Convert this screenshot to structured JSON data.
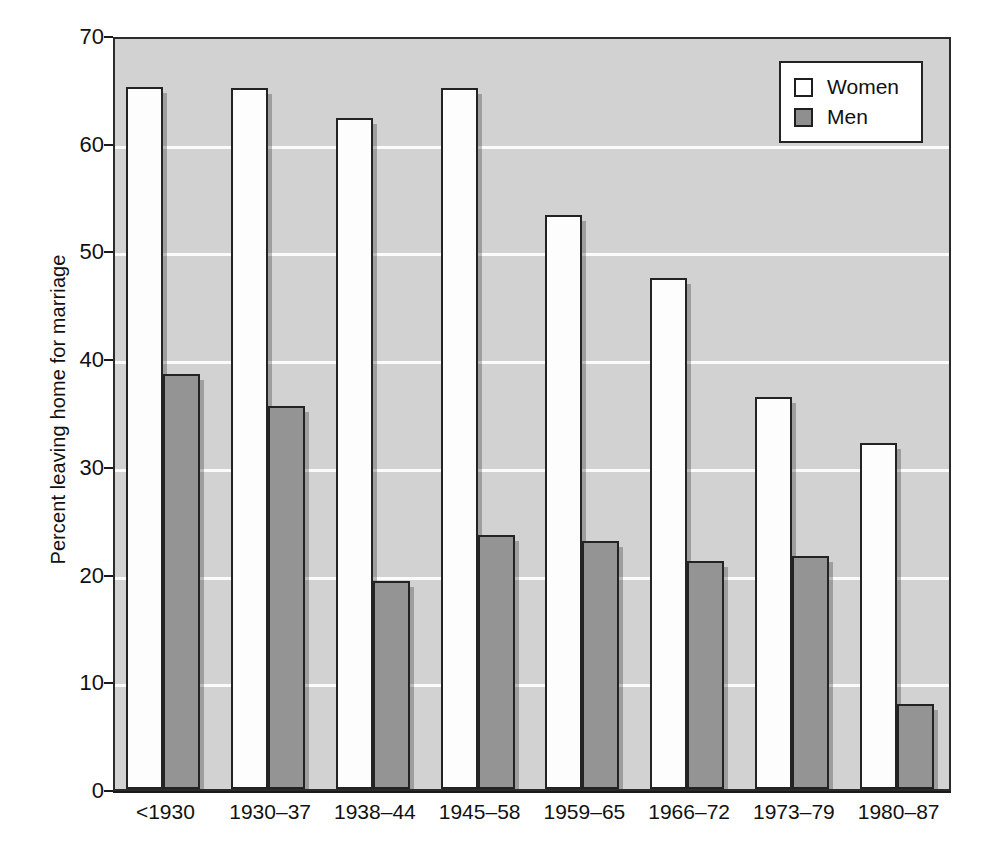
{
  "chart_data": {
    "type": "bar",
    "title": "",
    "xlabel": "",
    "ylabel": "Percent leaving home for marriage",
    "categories": [
      "<1930",
      "1930–37",
      "1938–44",
      "1945–58",
      "1959–65",
      "1966–72",
      "1973–79",
      "1980–87"
    ],
    "series": [
      {
        "name": "Women",
        "values": [
          65.2,
          65.1,
          62.3,
          65.1,
          53.3,
          47.4,
          36.4,
          32.1
        ]
      },
      {
        "name": "Men",
        "values": [
          38.5,
          35.6,
          19.3,
          23.6,
          23.0,
          21.2,
          21.6,
          7.9
        ]
      }
    ],
    "ylim": [
      0,
      70
    ],
    "yticks": [
      0,
      10,
      20,
      30,
      40,
      50,
      60,
      70
    ],
    "ytick_labels": [
      "0",
      "10",
      "20",
      "30",
      "40",
      "50",
      "60",
      "70"
    ],
    "gridlines": [
      10,
      20,
      30,
      40,
      50,
      60
    ],
    "grid": true,
    "legend_position": "top-right",
    "colors": {
      "women_fill": "#ffffff",
      "men_fill": "#8f8f8f",
      "plot_background": "#d2d2d2",
      "gridline": "#fbfbfb",
      "bar_outline": "#232323",
      "text": "#111111"
    }
  },
  "legend": {
    "items": [
      {
        "label": "Women",
        "swatch": "women"
      },
      {
        "label": "Men",
        "swatch": "men"
      }
    ]
  }
}
